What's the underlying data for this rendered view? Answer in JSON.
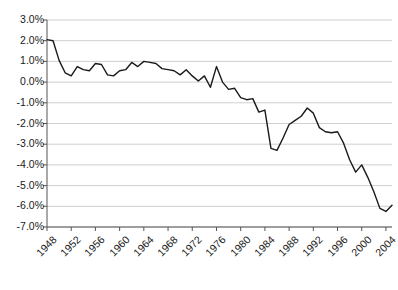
{
  "chart_data": {
    "type": "line",
    "title": "",
    "subtitle": "",
    "xlabel": "",
    "ylabel": "",
    "grid": true,
    "legend": "none",
    "ylim": [
      -7.0,
      3.0
    ],
    "yticks": [
      "3.0%",
      "2.0%",
      "1.0%",
      "0.0%",
      "-1.0%",
      "-2.0%",
      "-3.0%",
      "-4.0%",
      "-5.0%",
      "-6.0%",
      "-7.0%"
    ],
    "ytick_values": [
      3.0,
      2.0,
      1.0,
      0.0,
      -1.0,
      -2.0,
      -3.0,
      -4.0,
      -5.0,
      -6.0,
      -7.0
    ],
    "xlim": [
      1948,
      2005
    ],
    "xticks": [
      "1948",
      "1952",
      "1956",
      "1960",
      "1964",
      "1968",
      "1972",
      "1976",
      "1980",
      "1984",
      "1988",
      "1992",
      "1996",
      "2000",
      "2004"
    ],
    "xtick_values": [
      1948,
      1952,
      1956,
      1960,
      1964,
      1968,
      1972,
      1976,
      1980,
      1984,
      1988,
      1992,
      1996,
      2000,
      2004
    ],
    "series": [
      {
        "name": "value",
        "color": "#1a1a1a",
        "x": [
          1948,
          1949,
          1950,
          1951,
          1952,
          1953,
          1954,
          1955,
          1956,
          1957,
          1958,
          1959,
          1960,
          1961,
          1962,
          1963,
          1964,
          1965,
          1966,
          1967,
          1968,
          1969,
          1970,
          1971,
          1972,
          1973,
          1974,
          1975,
          1976,
          1977,
          1978,
          1979,
          1980,
          1981,
          1982,
          1983,
          1984,
          1985,
          1986,
          1987,
          1988,
          1989,
          1990,
          1991,
          1992,
          1993,
          1994,
          1995,
          1996,
          1997,
          1998,
          1999,
          2000,
          2001,
          2002,
          2003,
          2004,
          2005
        ],
        "values": [
          2.05,
          2.0,
          1.05,
          0.45,
          0.3,
          0.75,
          0.6,
          0.55,
          0.9,
          0.85,
          0.35,
          0.3,
          0.55,
          0.6,
          0.95,
          0.75,
          1.0,
          0.95,
          0.9,
          0.65,
          0.6,
          0.55,
          0.35,
          0.6,
          0.3,
          0.05,
          0.3,
          -0.25,
          0.75,
          0.0,
          -0.35,
          -0.3,
          -0.75,
          -0.85,
          -0.8,
          -1.45,
          -1.35,
          -3.2,
          -3.3,
          -2.7,
          -2.05,
          -1.85,
          -1.65,
          -1.25,
          -1.5,
          -2.2,
          -2.4,
          -2.45,
          -2.4,
          -2.95,
          -3.75,
          -4.35,
          -4.0,
          -4.6,
          -5.3,
          -6.1,
          -6.25,
          -5.95
        ]
      }
    ]
  },
  "axes": {
    "y_axis_name": "percent-axis",
    "x_axis_name": "year-axis"
  }
}
